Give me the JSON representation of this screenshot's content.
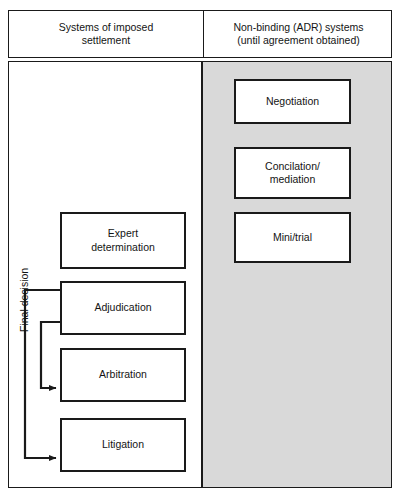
{
  "figure": {
    "colors": {
      "line": "#1a1a1a",
      "text": "#141414",
      "panel_background": "#ffffff",
      "shaded_panel_background": "#d9d9d9"
    }
  },
  "header": {
    "columns": [
      {
        "id": "imposed-settlement",
        "label": "Systems of imposed\nsettlement"
      },
      {
        "id": "non-binding-adr",
        "label": "Non-binding (ADR) systems\n(until agreement obtained)"
      }
    ]
  },
  "left_column": {
    "shaded": false,
    "boxes": [
      {
        "id": "expert-determination",
        "label": "Expert\ndetermination"
      },
      {
        "id": "adjudication",
        "label": "Adjudication"
      },
      {
        "id": "arbitration",
        "label": "Arbitration"
      },
      {
        "id": "litigation",
        "label": "Litigation"
      }
    ]
  },
  "right_column": {
    "shaded": true,
    "boxes": [
      {
        "id": "negotiation",
        "label": "Negotiation"
      },
      {
        "id": "conciliation-mediation",
        "label": "Concilation/\nmediation"
      },
      {
        "id": "mini-trial",
        "label": "Mini/trial"
      }
    ]
  },
  "connectors": {
    "label": "Final decision",
    "arrows": [
      {
        "id": "adjudication-to-arbitration",
        "from": "adjudication",
        "to": "arbitration",
        "arrowhead": true
      },
      {
        "id": "adjudication-to-litigation",
        "from": "adjudication",
        "to": "litigation",
        "arrowhead": true
      }
    ]
  }
}
